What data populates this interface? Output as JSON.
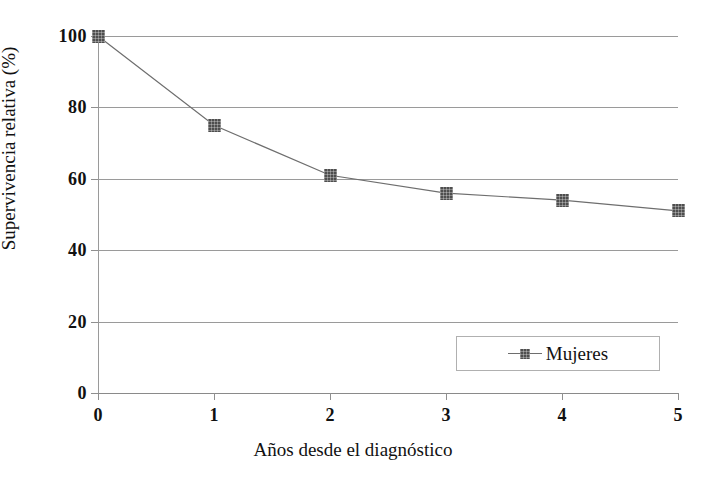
{
  "chart_data": {
    "type": "line",
    "title": "",
    "xlabel": "Años desde el diagnóstico",
    "ylabel": "Supervivencia relativa (%)",
    "x": [
      0,
      1,
      2,
      3,
      4,
      5
    ],
    "xticklabels": [
      "0",
      "1",
      "2",
      "3",
      "4",
      "5"
    ],
    "yticklabels": [
      "0",
      "20",
      "40",
      "60",
      "80",
      "100"
    ],
    "yticks": [
      0,
      20,
      40,
      60,
      80,
      100
    ],
    "xlim": [
      0,
      5
    ],
    "ylim": [
      0,
      100
    ],
    "grid": "horizontal",
    "legend_position": "lower right",
    "series": [
      {
        "name": "Mujeres",
        "values": [
          100,
          75,
          61,
          56,
          54,
          51
        ],
        "color": "#4e4e4e",
        "marker": "square",
        "line_color": "#6e6e6e"
      }
    ]
  },
  "legend": {
    "entries": [
      {
        "label": "Mujeres"
      }
    ]
  },
  "axes": {
    "y_title": "Supervivencia relativa (%)",
    "x_title": "Años desde el diagnóstico"
  },
  "colors": {
    "marker": "#4e4e4e",
    "line": "#6e6e6e",
    "grid": "#9a9a9a",
    "text": "#111111",
    "background": "#ffffff"
  }
}
